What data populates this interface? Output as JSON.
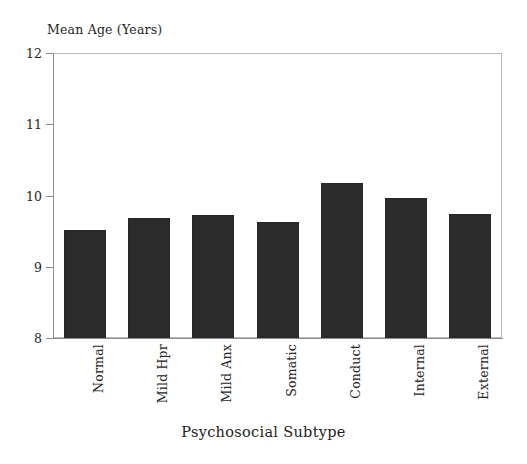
{
  "chart_data": {
    "type": "bar",
    "title": "",
    "xlabel": "Psychosocial Subtype",
    "ylabel": "Mean Age (Years)",
    "categories": [
      "Normal",
      "Mild Hpr",
      "Mild Anx",
      "Somatic",
      "Conduct",
      "Internal",
      "External"
    ],
    "values": [
      9.52,
      9.68,
      9.73,
      9.63,
      10.18,
      9.97,
      9.74
    ],
    "ylim": [
      8,
      12
    ],
    "yticks": [
      8,
      9,
      10,
      11,
      12
    ],
    "ytick_labels": [
      "8",
      "9",
      "10",
      "11",
      "12"
    ],
    "grid": false,
    "legend": null,
    "bar_color": "#2b2b2b",
    "frame_color": "#b9b9b9"
  },
  "axes": {
    "y_title": "Mean Age (Years)",
    "x_title": "Psychosocial Subtype"
  }
}
